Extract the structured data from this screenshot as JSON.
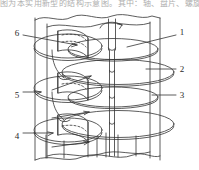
{
  "figure": {
    "top_text_strip": "图为本实用新型的结构示意图。其中：轴、盘片、螺旋叶片",
    "stroke_color": "#333333",
    "background_color": "#ffffff",
    "callouts": [
      {
        "id": "1",
        "label": "1",
        "side": "right",
        "x": 182,
        "y": 32,
        "leader_from_x": 176,
        "leader_from_y": 35,
        "leader_to_x": 127,
        "leader_to_y": 47
      },
      {
        "id": "2",
        "label": "2",
        "side": "right",
        "x": 182,
        "y": 69,
        "leader_from_x": 176,
        "leader_from_y": 69,
        "leader_to_x": 146,
        "leader_to_y": 69
      },
      {
        "id": "3",
        "label": "3",
        "side": "right",
        "x": 182,
        "y": 95,
        "leader_from_x": 176,
        "leader_from_y": 95,
        "leader_to_x": 152,
        "leader_to_y": 95
      },
      {
        "id": "4",
        "label": "4",
        "side": "left",
        "x": 17,
        "y": 136,
        "leader_from_x": 23,
        "leader_from_y": 133,
        "leader_to_x": 52,
        "leader_to_y": 133
      },
      {
        "id": "5",
        "label": "5",
        "side": "left",
        "x": 17,
        "y": 95,
        "leader_from_x": 23,
        "leader_from_y": 92,
        "leader_to_x": 40,
        "leader_to_y": 92
      },
      {
        "id": "6",
        "label": "6",
        "side": "left",
        "x": 17,
        "y": 33,
        "leader_from_x": 23,
        "leader_from_y": 35,
        "leader_to_x": 76,
        "leader_to_y": 45
      }
    ],
    "internal_arrows": [
      {
        "name": "disk-2-pointer",
        "from_x": 52,
        "from_y": 90,
        "to_x": 92,
        "to_y": 76
      },
      {
        "name": "disk-3-pointer",
        "from_x": 52,
        "from_y": 118,
        "to_x": 90,
        "to_y": 112
      },
      {
        "name": "disk-4-pointer",
        "from_x": 52,
        "from_y": 146,
        "to_x": 90,
        "to_y": 142
      },
      {
        "name": "rotation-arrow",
        "from_x": 101,
        "from_y": 27,
        "to_x": 124,
        "to_y": 32
      }
    ],
    "vessel": {
      "name": "vessel-body",
      "left_wall_x": 35,
      "right_wall_x": 160,
      "top_y": 16,
      "bottom_y": 160
    },
    "shaft": {
      "name": "rotor-shaft",
      "center_x": 112,
      "top_y": 19,
      "bottom_y": 152,
      "width": 7
    },
    "disks": [
      {
        "name": "disk-1",
        "cx": 112,
        "cy": 50,
        "rx": 48,
        "ry": 11
      },
      {
        "name": "disk-2",
        "cx": 118,
        "cy": 72,
        "rx": 58,
        "ry": 13
      },
      {
        "name": "disk-3",
        "cx": 112,
        "cy": 98,
        "rx": 48,
        "ry": 10
      },
      {
        "name": "disk-4",
        "cx": 118,
        "cy": 124,
        "rx": 58,
        "ry": 14
      }
    ],
    "helix": {
      "name": "helical-blade",
      "cx": 66,
      "rx": 36,
      "ry": 13,
      "turns": 3,
      "top_y": 42,
      "pitch": 40
    }
  }
}
